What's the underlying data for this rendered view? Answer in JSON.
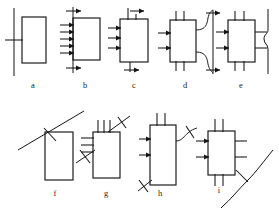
{
  "figure": {
    "background_color": "#ffffff",
    "ink_color": "#141414",
    "width": 279,
    "height": 212,
    "rows": 2,
    "panel_count": 9
  },
  "panels": [
    {
      "id": "a",
      "label": "a",
      "label_x": 33,
      "label_y": 88,
      "row": 1,
      "description": "vertical line with single crossing tick beside an empty rectangle",
      "box": {
        "x": 22,
        "y": 17,
        "w": 24,
        "h": 46
      },
      "vertical_line": {
        "x": 14,
        "y1": 8,
        "y2": 76
      },
      "tick_count": 1,
      "arrow_count": 0
    },
    {
      "id": "b",
      "label": "b",
      "label_x": 85,
      "label_y": 88,
      "row": 1,
      "description": "rectangle with vertical boundary line, five inward arrows on left, arrowheads top and bottom",
      "box": {
        "x": 73,
        "y": 18,
        "w": 27,
        "h": 42
      },
      "vertical_line": {
        "x": 73,
        "y1": 7,
        "y2": 73
      },
      "left_arrow_count": 5,
      "top_arrow": true,
      "bottom_arrow": true
    },
    {
      "id": "c",
      "label": "c",
      "label_x": 134,
      "label_y": 88,
      "row": 1,
      "description": "rectangle with three inward arrows left, two top leads, bottom arrow",
      "box": {
        "x": 120,
        "y": 19,
        "w": 28,
        "h": 43
      },
      "left_arrow_count": 3,
      "top_lead_count": 2,
      "bottom_arrow": true
    },
    {
      "id": "d",
      "label": "d",
      "label_x": 185,
      "label_y": 88,
      "row": 1,
      "description": "rectangle with top and left leads plus two S-curved leads to a vertical arrow line on the right",
      "box": {
        "x": 170,
        "y": 20,
        "w": 26,
        "h": 42
      },
      "left_arrow_count": 2,
      "top_lead_count": 2,
      "bottom_lead_count": 2,
      "curve_count": 2,
      "right_vertical_line": {
        "x": 213,
        "y1": 10,
        "y2": 74
      }
    },
    {
      "id": "e",
      "label": "e",
      "label_x": 241,
      "label_y": 88,
      "row": 1,
      "description": "rectangle with arrows on all four sides beside a wavy vertical line",
      "box": {
        "x": 228,
        "y": 20,
        "w": 27,
        "h": 42
      },
      "left_arrow_count": 2,
      "right_arrow_count": 2,
      "top_lead_count": 2,
      "bottom_lead_count": 2,
      "wavy_line": {
        "x": 268,
        "y1": 10,
        "y2": 74
      }
    },
    {
      "id": "f",
      "label": "f",
      "label_x": 55,
      "label_y": 196,
      "row": 2,
      "description": "rectangle with a long diagonal line crossed by a short tick above-left",
      "box": {
        "x": 45,
        "y": 132,
        "w": 28,
        "h": 48
      },
      "diagonal": {
        "x1": 18,
        "y1": 148,
        "x2": 82,
        "y2": 112
      },
      "tick_count": 1
    },
    {
      "id": "g",
      "label": "g",
      "label_x": 106,
      "label_y": 196,
      "row": 2,
      "description": "rectangle with top and left leads, diagonal with tick upper-right and diagonal with tick lower-left",
      "box": {
        "x": 93,
        "y": 132,
        "w": 27,
        "h": 46
      },
      "top_lead_count": 3,
      "left_lead_count": 3,
      "diagonal_count": 2,
      "tick_count": 2
    },
    {
      "id": "h",
      "label": "h",
      "label_x": 158,
      "label_y": 196,
      "row": 2,
      "description": "rectangle with top and left leads, a curved lead exiting right crossed by a tick, and a diagonal at lower-left",
      "box": {
        "x": 150,
        "y": 125,
        "w": 26,
        "h": 60
      },
      "top_lead_count": 2,
      "left_arrow_count": 2,
      "curve_count": 1,
      "tick_count": 2
    },
    {
      "id": "i",
      "label": "i",
      "label_x": 219,
      "label_y": 193,
      "row": 2,
      "description": "rectangle with leads all around and a long sweeping diagonal crossed by a tick at lower-right",
      "box": {
        "x": 208,
        "y": 131,
        "w": 27,
        "h": 44
      },
      "left_arrow_count": 2,
      "right_arrow_count": 2,
      "top_lead_count": 2,
      "bottom_lead_count": 2,
      "diagonal_count": 1,
      "tick_count": 1
    }
  ]
}
